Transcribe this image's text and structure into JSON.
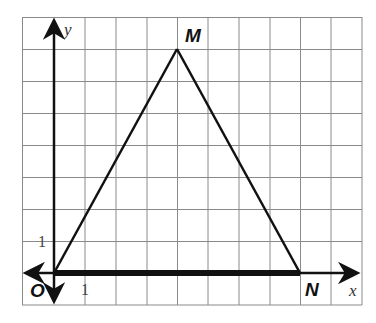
{
  "diagram": {
    "type": "coordinate-plane-triangle",
    "grid": {
      "cols": 11,
      "rows": 9,
      "x_min": -1,
      "x_max": 10,
      "y_min": -1,
      "y_max": 8,
      "color": "#8a8a8a"
    },
    "axes": {
      "x_label": "x",
      "y_label": "y",
      "x_tick_label": "1",
      "y_tick_label": "1",
      "color": "#111111"
    },
    "points": [
      {
        "name": "O",
        "label": "O",
        "x": 0,
        "y": 0
      },
      {
        "name": "M",
        "label": "M",
        "x": 4,
        "y": 7
      },
      {
        "name": "N",
        "label": "N",
        "x": 8,
        "y": 0
      }
    ],
    "segments": [
      {
        "from": "O",
        "to": "M",
        "weight": "normal"
      },
      {
        "from": "M",
        "to": "N",
        "weight": "normal"
      },
      {
        "from": "O",
        "to": "N",
        "weight": "bold"
      }
    ]
  }
}
